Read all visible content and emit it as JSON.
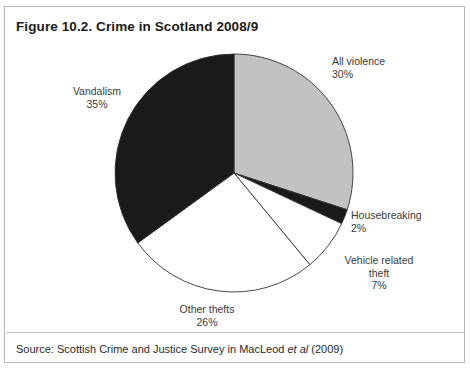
{
  "figure": {
    "title": "Figure 10.2. Crime in Scotland 2008/9",
    "source_prefix": "Source: Scottish Crime and Justice Survey in MacLeod ",
    "source_italic": "et al",
    "source_suffix": " (2009)"
  },
  "labels": {
    "all_violence": "All violence\n30%",
    "vandalism": "Vandalism\n35%",
    "housebreaking": "Housebreaking\n2%",
    "vehicle_theft": "Vehicle related\ntheft\n7%",
    "other_thefts": "Other thefts\n26%"
  },
  "chart_data": {
    "type": "pie",
    "title": "Figure 10.2. Crime in Scotland 2008/9",
    "subtitle": "",
    "xlabel": "",
    "ylabel": "",
    "legend_position": "none",
    "grid": false,
    "start_angle_deg": 0,
    "direction": "clockwise",
    "units": "percent",
    "total": 100,
    "categories": [
      "All violence",
      "Housebreaking",
      "Vehicle related theft",
      "Other thefts",
      "Vandalism"
    ],
    "values": [
      30,
      2,
      7,
      26,
      35
    ],
    "slice_colors": [
      "#c2c2c2",
      "#1a1a1a",
      "#ffffff",
      "#ffffff",
      "#1a1a1a"
    ],
    "slice_outline_color": "#333333",
    "annotations": [
      "All violence 30%",
      "Housebreaking 2%",
      "Vehicle related theft 7%",
      "Other thefts 26%",
      "Vandalism 35%"
    ],
    "geometry": {
      "cx": 229,
      "cy": 166,
      "r": 119
    }
  },
  "colors": {
    "frame_border": "#b9b9b9",
    "background": "#ffffff",
    "text": "#231f20",
    "gray_slice": "#c2c2c2",
    "black_slice": "#1a1a1a",
    "white_slice": "#ffffff"
  }
}
